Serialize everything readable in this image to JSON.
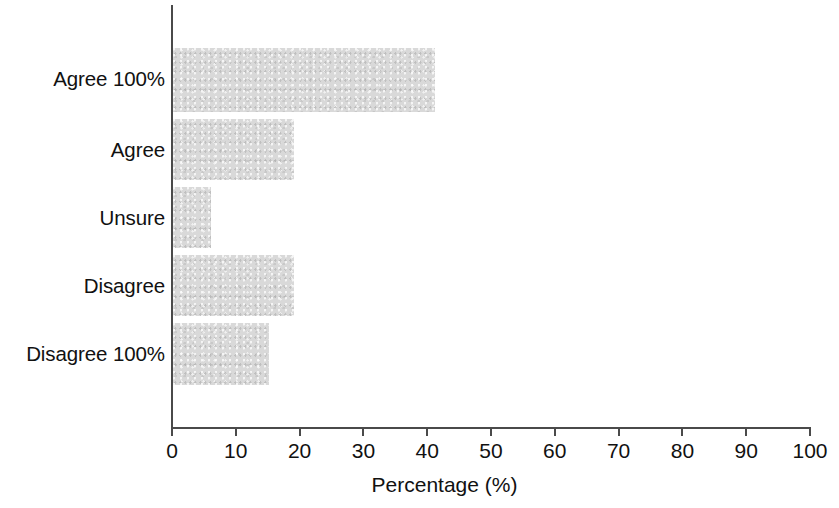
{
  "chart_data": {
    "type": "bar",
    "orientation": "horizontal",
    "title": "",
    "xlabel": "Percentage (%)",
    "ylabel": "",
    "categories": [
      "Agree 100%",
      "Agree",
      "Unsure",
      "Disagree",
      "Disagree 100%"
    ],
    "values": [
      41,
      19,
      6,
      19,
      15
    ],
    "xlim": [
      0,
      100
    ],
    "xticks": [
      0,
      10,
      20,
      30,
      40,
      50,
      60,
      70,
      80,
      90,
      100
    ],
    "xtick_labels": [
      "0",
      "10",
      "20",
      "30",
      "40",
      "50",
      "60",
      "70",
      "80",
      "90",
      "100"
    ],
    "grid": false,
    "legend": null,
    "bar_color": "#d9d9d9",
    "axis_color": "#4a4a4a",
    "text_color": "#111111",
    "background": "#ffffff"
  }
}
